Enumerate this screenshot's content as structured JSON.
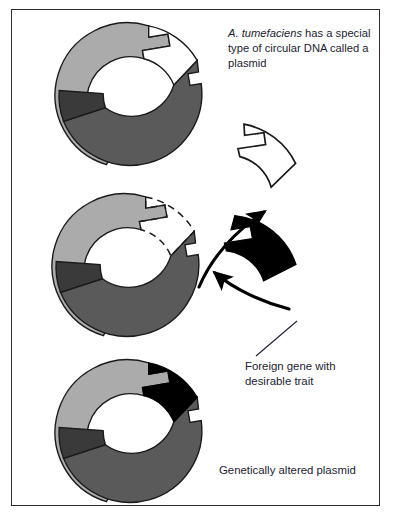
{
  "figure": {
    "background_color": "#ffffff",
    "border_color": "#2b2b2b"
  },
  "captions": {
    "plasmid_intro": {
      "italic_part": "A. tumefaciens",
      "rest": " has a special type of circular DNA called a plasmid"
    },
    "foreign_gene": "Foreign gene with\ndesirable trait",
    "altered_plasmid": "Genetically altered plasmid"
  },
  "palette": {
    "light_gray": "#ababab",
    "medium_gray": "#5a5a5a",
    "dark_gray": "#3a3a3a",
    "black": "#000000",
    "white": "#ffffff",
    "outline": "#1a1a1a",
    "text": "#1c1c33"
  },
  "diagram_data": {
    "type": "process-diagram",
    "stages": [
      {
        "name": "original-plasmid",
        "label": "A. tumefaciens plasmid",
        "center": [
          131,
          97
        ],
        "outer_radius": 72,
        "inner_radius": 44,
        "segments": [
          {
            "name": "light-gray-segment",
            "color": "#ababab",
            "start_deg": 250,
            "end_deg": 352
          },
          {
            "name": "cut-gap-segment",
            "color": "#ffffff",
            "start_deg": 352,
            "end_deg": 58
          },
          {
            "name": "medium-gray-segment",
            "color": "#5a5a5a",
            "start_deg": 58,
            "end_deg": 160
          },
          {
            "name": "dark-gray-segment",
            "color": "#3a3a3a",
            "start_deg": 160,
            "end_deg": 250
          }
        ]
      },
      {
        "name": "cut-plasmid",
        "label": "Plasmid with fragment excised",
        "center": [
          128,
          268
        ],
        "outer_radius": 72,
        "inner_radius": 44,
        "segments": [
          {
            "name": "light-gray-segment",
            "color": "#ababab",
            "start_deg": 250,
            "end_deg": 352
          },
          {
            "name": "dashed-void-segment",
            "color": "#ffffff",
            "start_deg": 352,
            "end_deg": 58,
            "stroke": "dashed"
          },
          {
            "name": "medium-gray-segment",
            "color": "#5a5a5a",
            "start_deg": 58,
            "end_deg": 160
          },
          {
            "name": "dark-gray-segment",
            "color": "#3a3a3a",
            "start_deg": 160,
            "end_deg": 250
          }
        ]
      },
      {
        "name": "altered-plasmid",
        "label": "Genetically altered plasmid",
        "center": [
          131,
          434
        ],
        "outer_radius": 72,
        "inner_radius": 44,
        "segments": [
          {
            "name": "light-gray-segment",
            "color": "#ababab",
            "start_deg": 250,
            "end_deg": 352
          },
          {
            "name": "inserted-foreign-gene-segment",
            "color": "#000000",
            "start_deg": 352,
            "end_deg": 58
          },
          {
            "name": "medium-gray-segment",
            "color": "#5a5a5a",
            "start_deg": 58,
            "end_deg": 160
          },
          {
            "name": "dark-gray-segment",
            "color": "#3a3a3a",
            "start_deg": 160,
            "end_deg": 250
          }
        ]
      }
    ],
    "fragments": [
      {
        "name": "excised-plasmid-fragment",
        "fill": "#ffffff",
        "outline": "#1a1a1a",
        "center": [
          232,
          196
        ],
        "outer_radius": 72,
        "inner_radius": 44,
        "start_deg": 340,
        "end_deg": 62
      },
      {
        "name": "foreign-gene-fragment",
        "fill": "#000000",
        "outline": "#000000",
        "center": [
          237,
          285
        ],
        "outer_radius": 72,
        "inner_radius": 44,
        "start_deg": 330,
        "end_deg": 52
      }
    ],
    "arrows": [
      {
        "name": "excision-arrow",
        "direction": "up-right",
        "from": [
          200,
          285
        ],
        "to": [
          268,
          212
        ]
      },
      {
        "name": "insertion-arrow",
        "direction": "up-left",
        "from": [
          283,
          305
        ],
        "to": [
          212,
          272
        ]
      }
    ],
    "leader_lines": [
      {
        "name": "foreign-gene-leader",
        "from": [
          297,
          323
        ],
        "to": [
          255,
          357
        ]
      }
    ]
  }
}
